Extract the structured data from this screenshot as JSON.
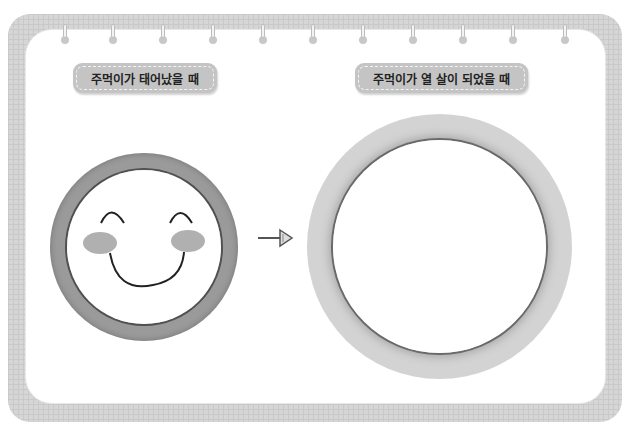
{
  "worksheet": {
    "labels": {
      "birth": "주먹이가 태어났을 때",
      "age_ten": "주먹이가 열 살이 되었을 때"
    },
    "rings": [
      65,
      113,
      163,
      213,
      263,
      313,
      363,
      413,
      463,
      513,
      565
    ],
    "icons": {
      "left": "smiley-face-icon",
      "arrow": "arrow-right-icon",
      "right": "empty-circle-drawing-area"
    },
    "colors": {
      "frame": "#d6d6d6",
      "label_bg": "#c4c4c4",
      "face_ring": "#9a9a9a",
      "big_ring": "#d3d3d3"
    }
  }
}
